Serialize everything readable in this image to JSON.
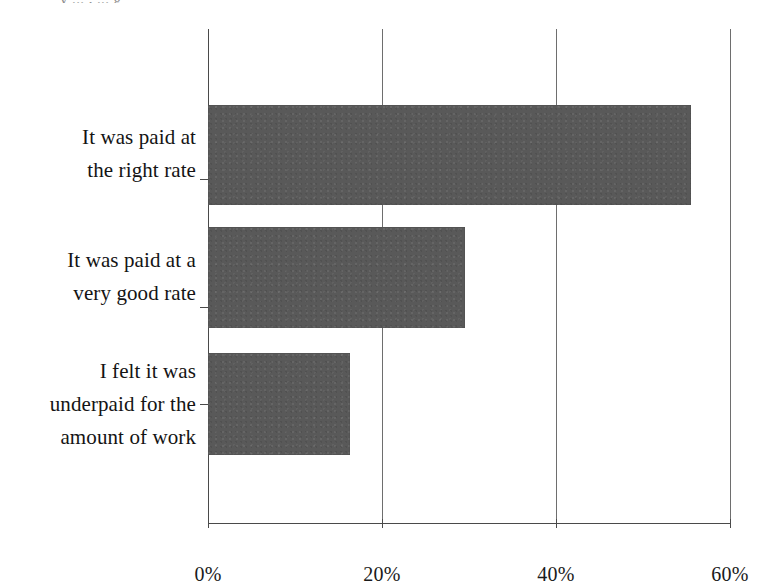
{
  "figure": {
    "title_remnant": "y ... ,    ... g",
    "background_color": "#ffffff",
    "bar_color": "#595959",
    "axis_color": "#4a4a4a",
    "gridline_color": "#6e6e6e"
  },
  "chart_data": {
    "type": "bar",
    "orientation": "horizontal",
    "title": "",
    "subtitle": "",
    "xlabel": "",
    "ylabel": "",
    "categories": [
      "It was paid at the right rate",
      "It was paid at a very good rate",
      "I felt it was underpaid for the amount of work"
    ],
    "category_lines": [
      [
        "It was paid at",
        "the right rate"
      ],
      [
        "It was paid at a",
        "very good rate"
      ],
      [
        "I felt it was",
        "underpaid for the",
        "amount of work"
      ]
    ],
    "values": [
      55.5,
      29.5,
      16.3
    ],
    "value_labels": [
      "55.5%",
      "29.5%",
      "16.3%"
    ],
    "xlim": [
      0,
      60
    ],
    "ylim": [
      0,
      3
    ],
    "xticks": [
      0,
      20,
      40,
      60
    ],
    "xtick_labels": [
      "0%",
      "20%",
      "40%",
      "60%"
    ],
    "grid": true,
    "grid_axis": "x",
    "legend": false,
    "legend_position": "none",
    "series": [
      {
        "name": "Percentage of respondents",
        "color": "#595959",
        "values": [
          55.5,
          29.5,
          16.3
        ]
      }
    ]
  }
}
